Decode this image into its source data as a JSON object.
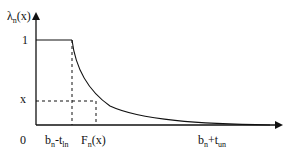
{
  "diagram": {
    "type": "function-plot",
    "y_axis_label": {
      "base": "λ",
      "sub": "n",
      "rest": "(x)"
    },
    "y_ticks": [
      {
        "id": "one",
        "text": "1",
        "y": 40
      },
      {
        "id": "x",
        "text": "x",
        "y": 101
      },
      {
        "id": "zero",
        "text": "0",
        "y": 125
      }
    ],
    "x_ticks": [
      {
        "id": "bn-tln",
        "base": "b",
        "sub1": "n",
        "mid": "-t",
        "sub2": "ln",
        "x": 72
      },
      {
        "id": "Fn",
        "base": "F",
        "sub1": "n",
        "mid": "(x)",
        "sub2": "",
        "x": 96
      },
      {
        "id": "bn+tun",
        "base": "b",
        "sub1": "n",
        "mid": "+t",
        "sub2": "un",
        "x": 220
      }
    ],
    "geometry": {
      "origin": [
        36,
        125
      ],
      "y_axis_top": 12,
      "x_axis_right": 283,
      "plateau_y": 40,
      "plateau_end_x": 72,
      "level_x_y": 101,
      "Fn_x": 96
    },
    "stroke_color": "#111111"
  }
}
